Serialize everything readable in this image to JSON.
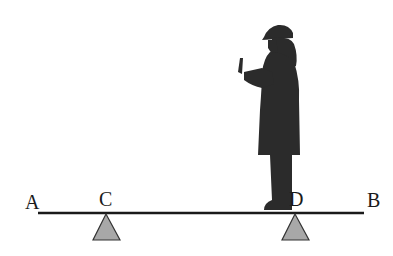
{
  "diagram": {
    "type": "lever / seesaw beam with two supports and a standing person",
    "labels": {
      "a": "A",
      "b": "B",
      "c": "C",
      "d": "D"
    },
    "colors": {
      "beam": "#1a1a1a",
      "support_fill": "#a8a8a8",
      "support_stroke": "#333333",
      "silhouette": "#2b2b2b"
    }
  }
}
